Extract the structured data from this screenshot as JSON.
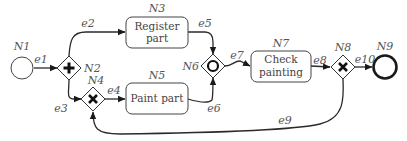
{
  "diagram": {
    "type": "BPMN process",
    "colors": {
      "stroke": "#2a2a2a",
      "label": "#555555",
      "background": "#ffffff"
    },
    "nodes": {
      "N1": {
        "id": "N1",
        "kind": "start-event"
      },
      "N2": {
        "id": "N2",
        "kind": "parallel-gateway",
        "symbol": "+"
      },
      "N3": {
        "id": "N3",
        "kind": "task",
        "line1": "Register",
        "line2": "part"
      },
      "N4": {
        "id": "N4",
        "kind": "exclusive-gateway",
        "symbol": "X"
      },
      "N5": {
        "id": "N5",
        "kind": "task",
        "line1": "Paint part"
      },
      "N6": {
        "id": "N6",
        "kind": "inclusive-gateway",
        "symbol": "O"
      },
      "N7": {
        "id": "N7",
        "kind": "task",
        "line1": "Check",
        "line2": "painting"
      },
      "N8": {
        "id": "N8",
        "kind": "exclusive-gateway",
        "symbol": "X"
      },
      "N9": {
        "id": "N9",
        "kind": "end-event"
      }
    },
    "edges": {
      "e1": {
        "id": "e1",
        "from": "N1",
        "to": "N2"
      },
      "e2": {
        "id": "e2",
        "from": "N2",
        "to": "N3"
      },
      "e3": {
        "id": "e3",
        "from": "N2",
        "to": "N4"
      },
      "e4": {
        "id": "e4",
        "from": "N4",
        "to": "N5"
      },
      "e5": {
        "id": "e5",
        "from": "N3",
        "to": "N6"
      },
      "e6": {
        "id": "e6",
        "from": "N5",
        "to": "N6"
      },
      "e7": {
        "id": "e7",
        "from": "N6",
        "to": "N7"
      },
      "e8": {
        "id": "e8",
        "from": "N7",
        "to": "N8"
      },
      "e9": {
        "id": "e9",
        "from": "N8",
        "to": "N4"
      },
      "e10": {
        "id": "e10",
        "from": "N8",
        "to": "N9"
      }
    }
  }
}
